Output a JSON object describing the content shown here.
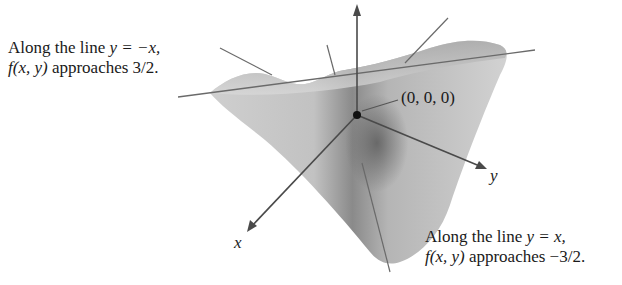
{
  "figure": {
    "annotation_left": {
      "line1_prefix": "Along the line ",
      "line1_math": "y = −x,",
      "line2_math": "f(x, y)",
      "line2_suffix": " approaches 3/2."
    },
    "annotation_right": {
      "line1_prefix": "Along the line ",
      "line1_math": "y = x,",
      "line2_math": "f(x, y)",
      "line2_suffix": " approaches −3/2."
    },
    "origin_label": "(0, 0, 0)",
    "axes": {
      "x": "x",
      "y": "y",
      "z": "z"
    },
    "colors": {
      "surface_light": "#d9d9d9",
      "surface_dark": "#6e6e6e",
      "axis": "#4a4a4a",
      "line": "#6a6a6a",
      "text": "#1a1a1a"
    }
  }
}
